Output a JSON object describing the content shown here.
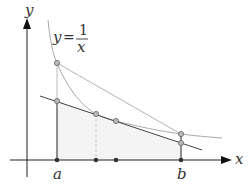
{
  "figure": {
    "axis_labels": {
      "x": "x",
      "y": "y"
    },
    "function_label": {
      "lhs": "y",
      "eq": "=",
      "numerator": "1",
      "denominator": "x"
    },
    "tick_labels": {
      "a": "a",
      "b": "b"
    },
    "colors": {
      "axis": "#222222",
      "curve": "#a9a9a9",
      "secant": "#b5b5b5",
      "tangent": "#444444",
      "shade": "#f4f4f4",
      "dashed": "#c8c8c8",
      "point_fill": "#b9b9b9",
      "point_stroke": "#666666",
      "axis_point": "#333333"
    }
  }
}
